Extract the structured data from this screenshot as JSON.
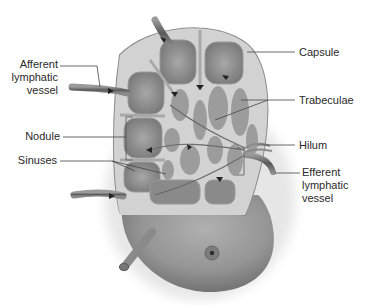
{
  "diagram": {
    "colors": {
      "capsule_fill": "#b8b8b8",
      "capsule_edge": "#8a8a8a",
      "nodule_fill": "#8c8c8c",
      "nodule_center": "#a4a4a4",
      "sinus_fill": "#d4d4d4",
      "lower_body": "#9a9a9a",
      "vessel": "#6e6e6e",
      "leader_line": "#444444",
      "label_text": "#2a2a2a"
    },
    "labels": {
      "afferent": "Afferent\nlymphatic\nvessel",
      "nodule": "Nodule",
      "sinuses": "Sinuses",
      "capsule": "Capsule",
      "trabeculae": "Trabeculae",
      "hilum": "Hilum",
      "efferent": "Efferent\nlymphatic\nvessel"
    }
  }
}
